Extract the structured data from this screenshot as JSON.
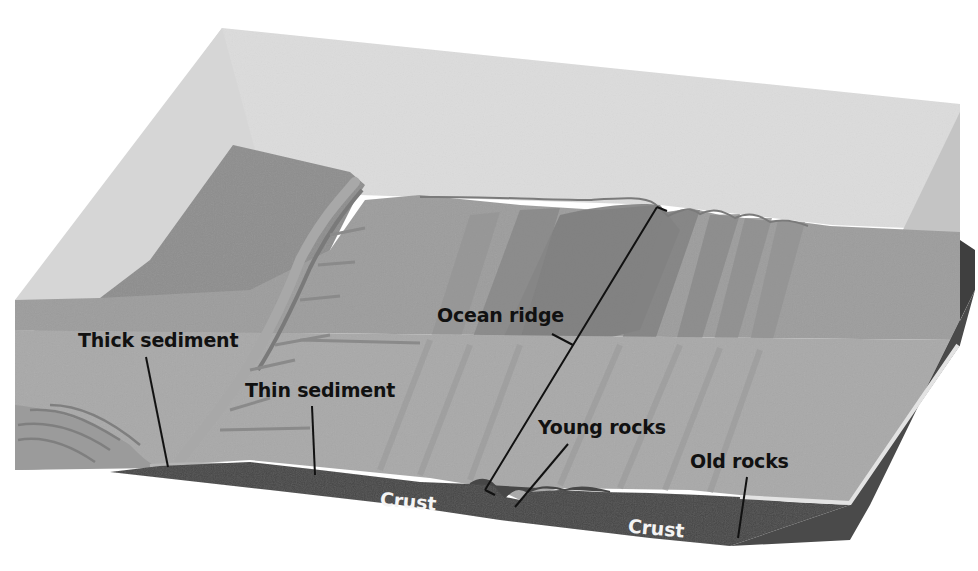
{
  "diagram": {
    "type": "3D block cross-section",
    "colors": {
      "background": "#ffffff",
      "water_top": "#d9d9d9",
      "water_side": "#c9c9c9",
      "continent": "#8f8f8f",
      "seafloor_far": "#9a9a9a",
      "seafloor_near": "#a8a8a8",
      "ridge_dark": "#7a7a7a",
      "sediment": "#b6b6b6",
      "crust": "#4a4a4a",
      "old_rock_edge": "#e2e2e2",
      "label_text": "#111111",
      "crust_text": "#f4f4f4"
    },
    "labels": {
      "thick_sediment": "Thick sediment",
      "thin_sediment": "Thin sediment",
      "ocean_ridge": "Ocean ridge",
      "young_rocks": "Young rocks",
      "old_rocks": "Old rocks",
      "crust_left": "Crust",
      "crust_right": "Crust"
    }
  }
}
